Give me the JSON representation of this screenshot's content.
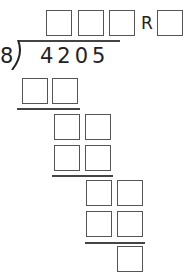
{
  "problem": {
    "divisor": "8",
    "dividend": "4205",
    "remainder_label": "R"
  },
  "answer_boxes": {
    "quotient_count": 3,
    "remainder_count": 1
  },
  "work_rows": [
    {
      "label": "step1-product",
      "boxes": 2
    },
    {
      "label": "step2-difference",
      "boxes": 2
    },
    {
      "label": "step2-product",
      "boxes": 2
    },
    {
      "label": "step3-difference",
      "boxes": 2
    },
    {
      "label": "step3-product",
      "boxes": 2
    },
    {
      "label": "final-remainder",
      "boxes": 1
    }
  ],
  "colors": {
    "box_border": "#555555",
    "line": "#444444",
    "text": "#222222"
  }
}
